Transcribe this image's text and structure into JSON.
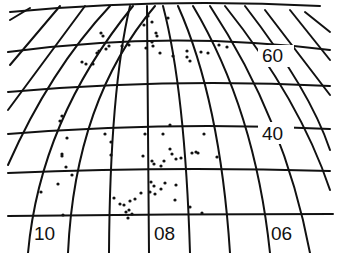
{
  "map": {
    "type": "celestial-star-chart",
    "grid": {
      "color": "#111111",
      "background": "#ffffff"
    },
    "declination_labels": [
      {
        "text": "60",
        "x": 262,
        "y": 62
      },
      {
        "text": "40",
        "x": 262,
        "y": 140
      }
    ],
    "ra_labels": [
      {
        "text": "10",
        "x": 34,
        "y": 240
      },
      {
        "text": "08",
        "x": 154,
        "y": 240
      },
      {
        "text": "06",
        "x": 271,
        "y": 240
      }
    ],
    "stars": [
      [
        148,
        16
      ],
      [
        152,
        22
      ],
      [
        144,
        25
      ],
      [
        156,
        33
      ],
      [
        157,
        36
      ],
      [
        168,
        18
      ],
      [
        103,
        36
      ],
      [
        109,
        46
      ],
      [
        106,
        49
      ],
      [
        97,
        53
      ],
      [
        99,
        51
      ],
      [
        82,
        62
      ],
      [
        86,
        64
      ],
      [
        93,
        64
      ],
      [
        101,
        33
      ],
      [
        122,
        46
      ],
      [
        129,
        45
      ],
      [
        146,
        48
      ],
      [
        152,
        42
      ],
      [
        153,
        46
      ],
      [
        160,
        53
      ],
      [
        173,
        56
      ],
      [
        187,
        51
      ],
      [
        187,
        57
      ],
      [
        190,
        61
      ],
      [
        201,
        52
      ],
      [
        208,
        53
      ],
      [
        219,
        45
      ],
      [
        227,
        47
      ],
      [
        62,
        116
      ],
      [
        60,
        121
      ],
      [
        67,
        138
      ],
      [
        62,
        154
      ],
      [
        62,
        156
      ],
      [
        66,
        167
      ],
      [
        72,
        175
      ],
      [
        58,
        184
      ],
      [
        41,
        192
      ],
      [
        63,
        215
      ],
      [
        105,
        134
      ],
      [
        111,
        142
      ],
      [
        111,
        155
      ],
      [
        145,
        134
      ],
      [
        163,
        134
      ],
      [
        170,
        125
      ],
      [
        204,
        134
      ],
      [
        143,
        156
      ],
      [
        152,
        161
      ],
      [
        154,
        164
      ],
      [
        161,
        166
      ],
      [
        164,
        161
      ],
      [
        172,
        154
      ],
      [
        170,
        149
      ],
      [
        176,
        159
      ],
      [
        181,
        158
      ],
      [
        192,
        153
      ],
      [
        196,
        152
      ],
      [
        198,
        153
      ],
      [
        217,
        157
      ],
      [
        151,
        182
      ],
      [
        154,
        186
      ],
      [
        150,
        192
      ],
      [
        161,
        189
      ],
      [
        165,
        183
      ],
      [
        176,
        185
      ],
      [
        175,
        200
      ],
      [
        155,
        194
      ],
      [
        114,
        198
      ],
      [
        120,
        204
      ],
      [
        124,
        205
      ],
      [
        130,
        201
      ],
      [
        129,
        210
      ],
      [
        135,
        199
      ],
      [
        141,
        193
      ],
      [
        126,
        212
      ],
      [
        132,
        214
      ],
      [
        128,
        218
      ],
      [
        190,
        207
      ],
      [
        202,
        213
      ]
    ]
  }
}
